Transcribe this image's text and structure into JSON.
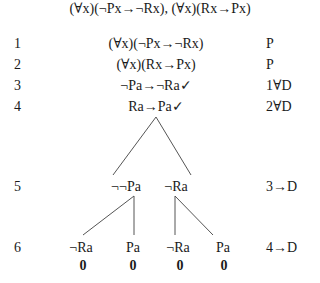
{
  "title": "(∀x)(¬Px→¬Rx), (∀x)(Rx→Px)",
  "rows": [
    {
      "num": "1",
      "formula": "(∀x)(¬Px→¬Rx)",
      "just": "P"
    },
    {
      "num": "2",
      "formula": "(∀x)(Rx→Px)",
      "just": "P"
    },
    {
      "num": "3",
      "formula": "¬Pa→¬Ra✓",
      "just": "1∀D"
    },
    {
      "num": "4",
      "formula": "Ra→Pa✓",
      "just": "2∀D"
    }
  ],
  "branch_row5": {
    "num": "5",
    "left": "¬¬Pa",
    "right": "¬Ra",
    "just": "3→D"
  },
  "branch_row6": {
    "num": "6",
    "nodes": [
      "¬Ra",
      "Pa",
      "¬Ra",
      "Pa"
    ],
    "just": "4→D"
  },
  "closures": [
    "0",
    "0",
    "0",
    "0"
  ]
}
